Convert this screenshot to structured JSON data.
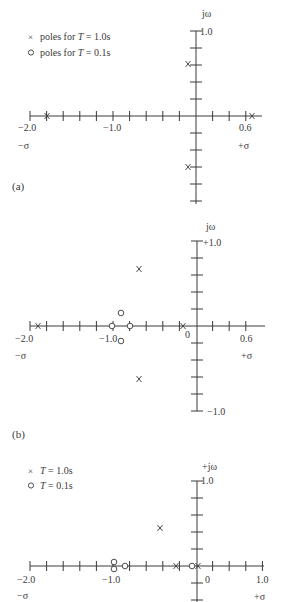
{
  "figure": {
    "width": 284,
    "height": 602,
    "ink_color": "#3a3a3a",
    "background": "#ffffff"
  },
  "panels": [
    {
      "id": "a",
      "label": "(a)",
      "label_pos": [
        12,
        190
      ],
      "origin_px": [
        196,
        116
      ],
      "px_per_unit_x": 83,
      "px_per_unit_y": 85,
      "x_axis": {
        "from_px": 30,
        "to_px": 262,
        "tick_step_px": 16.6,
        "tick_from_px": 30,
        "tick_to_px": 246
      },
      "y_axis": {
        "from_px": 31,
        "to_px": 204,
        "tick_step_px": 17,
        "top_tick": true,
        "bottom_tick": false
      },
      "axis_labels": [
        {
          "text": "jω",
          "x": 202,
          "y": 17,
          "size": 10
        },
        {
          "text": "1.0",
          "x": 200,
          "y": 35,
          "size": 10
        },
        {
          "text": "−2.0",
          "x": 18,
          "y": 131,
          "size": 10
        },
        {
          "text": "−1.0",
          "x": 103,
          "y": 131,
          "size": 10
        },
        {
          "text": "0.6",
          "x": 239,
          "y": 131,
          "size": 10
        },
        {
          "text": "−σ",
          "x": 18,
          "y": 149,
          "size": 10
        },
        {
          "text": "+σ",
          "x": 238,
          "y": 149,
          "size": 10
        }
      ],
      "legend": [
        {
          "marker": "x",
          "prefix": "x",
          "text": "poles for ",
          "var": "T",
          "rest": " = 1.0s",
          "x": 40,
          "y": 40
        },
        {
          "marker": "o",
          "prefix": "o",
          "text": "poles for ",
          "var": "T",
          "rest": " = 0.1s",
          "x": 40,
          "y": 56
        }
      ],
      "poles": [
        {
          "type": "x",
          "sigma": -1.82,
          "omega": 0.0,
          "px": [
            47,
            116
          ]
        },
        {
          "type": "x",
          "sigma": 0.65,
          "omega": 0.0,
          "px": [
            252,
            116
          ]
        },
        {
          "type": "x",
          "sigma": -0.1,
          "omega": 0.6,
          "px": [
            188,
            64
          ]
        },
        {
          "type": "x",
          "sigma": -0.1,
          "omega": -0.6,
          "px": [
            188,
            167
          ]
        }
      ]
    },
    {
      "id": "b",
      "label": "(b)",
      "label_pos": [
        12,
        438
      ],
      "origin_px": [
        197,
        326
      ],
      "px_per_unit_x": 83,
      "px_per_unit_y": 85,
      "x_axis": {
        "from_px": 30,
        "to_px": 265,
        "tick_step_px": 16.6,
        "tick_from_px": 30,
        "tick_to_px": 247
      },
      "y_axis": {
        "from_px": 241,
        "to_px": 411,
        "tick_step_px": 17,
        "top_tick": true,
        "bottom_tick": true
      },
      "axis_labels": [
        {
          "text": "jω",
          "x": 206,
          "y": 230,
          "size": 10
        },
        {
          "text": "+1.0",
          "x": 203,
          "y": 246,
          "size": 10
        },
        {
          "text": "−1.0",
          "x": 207,
          "y": 415,
          "size": 10
        },
        {
          "text": "−2.0",
          "x": 15,
          "y": 342,
          "size": 10
        },
        {
          "text": "−1.0",
          "x": 99,
          "y": 342,
          "size": 10
        },
        {
          "text": "0",
          "x": 185,
          "y": 338,
          "size": 10
        },
        {
          "text": "0.6",
          "x": 240,
          "y": 342,
          "size": 10
        },
        {
          "text": "−σ",
          "x": 15,
          "y": 359,
          "size": 10
        },
        {
          "text": "+σ",
          "x": 241,
          "y": 359,
          "size": 10
        }
      ],
      "legend": [],
      "poles": [
        {
          "type": "x",
          "sigma": -1.85,
          "omega": 0.0,
          "px": [
            38,
            326
          ]
        },
        {
          "type": "x",
          "sigma": -0.1,
          "omega": 0.0,
          "px": [
            183,
            326
          ]
        },
        {
          "type": "x",
          "sigma": -0.7,
          "omega": 0.68,
          "px": [
            139,
            269
          ]
        },
        {
          "type": "x",
          "sigma": -0.7,
          "omega": -0.68,
          "px": [
            139,
            379
          ]
        },
        {
          "type": "o",
          "sigma": -1.0,
          "omega": 0.0,
          "px": [
            112,
            326
          ]
        },
        {
          "type": "o",
          "sigma": -0.83,
          "omega": 0.0,
          "px": [
            130,
            326
          ]
        },
        {
          "type": "o",
          "sigma": -0.92,
          "omega": 0.15,
          "px": [
            121,
            313
          ]
        },
        {
          "type": "o",
          "sigma": -0.92,
          "omega": -0.17,
          "px": [
            121,
            341
          ]
        }
      ]
    },
    {
      "id": "c",
      "label": "",
      "label_pos": [
        12,
        0
      ],
      "origin_px": [
        197,
        566
      ],
      "px_per_unit_x": 83,
      "px_per_unit_y": 85,
      "x_axis": {
        "from_px": 30,
        "to_px": 264,
        "tick_step_px": 16.6,
        "tick_from_px": 30,
        "tick_to_px": 264
      },
      "y_axis": {
        "from_px": 481,
        "to_px": 602,
        "tick_step_px": 17,
        "top_tick": true,
        "bottom_tick": false
      },
      "axis_labels": [
        {
          "text": "+jω",
          "x": 202,
          "y": 470,
          "size": 10
        },
        {
          "text": "1.0",
          "x": 201,
          "y": 484,
          "size": 10
        },
        {
          "text": "−2.0",
          "x": 17,
          "y": 583,
          "size": 10
        },
        {
          "text": "−1.0",
          "x": 102,
          "y": 583,
          "size": 10
        },
        {
          "text": "0",
          "x": 205,
          "y": 583,
          "size": 10
        },
        {
          "text": "1.0",
          "x": 256,
          "y": 583,
          "size": 10
        },
        {
          "text": "−σ",
          "x": 17,
          "y": 599,
          "size": 10
        },
        {
          "text": "+σ",
          "x": 254,
          "y": 600,
          "size": 10
        }
      ],
      "legend": [
        {
          "marker": "x",
          "prefix": "x",
          "text": "",
          "var": "T",
          "rest": " = 1.0s",
          "x": 40,
          "y": 474
        },
        {
          "marker": "o",
          "prefix": "o",
          "text": "",
          "var": "T",
          "rest": " = 0.1s",
          "x": 40,
          "y": 489
        }
      ],
      "poles": [
        {
          "type": "o",
          "sigma": -1.0,
          "omega": 0.05,
          "px": [
            114,
            562
          ]
        },
        {
          "type": "o",
          "sigma": -1.0,
          "omega": -0.05,
          "px": [
            114,
            569
          ]
        },
        {
          "type": "o",
          "sigma": -0.87,
          "omega": 0.0,
          "px": [
            125,
            566
          ]
        },
        {
          "type": "x",
          "sigma": -0.25,
          "omega": 0.0,
          "px": [
            176,
            566
          ]
        },
        {
          "type": "o",
          "sigma": -0.05,
          "omega": 0.0,
          "px": [
            192,
            566
          ]
        },
        {
          "type": "x",
          "sigma": 0.0,
          "omega": 0.0,
          "px": [
            198,
            566
          ]
        },
        {
          "type": "x",
          "sigma": -0.45,
          "omega": 0.45,
          "px": [
            160,
            528
          ]
        }
      ]
    }
  ]
}
